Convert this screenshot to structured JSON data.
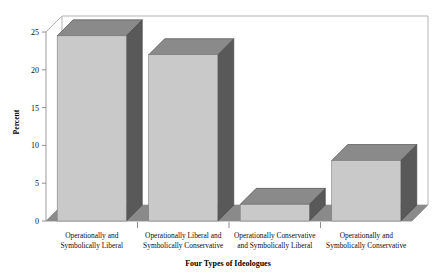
{
  "chart_data": {
    "type": "bar",
    "title": "",
    "xlabel": "Four Types of Ideologues",
    "ylabel": "Percent",
    "categories": [
      "Operationally and Symbolically Liberal",
      "Operationally Liberal and Symbolically Conservative",
      "Operationally Conservative and Symbolically Liberal",
      "Operationally and Symbolically Conservative"
    ],
    "category_lines": [
      [
        "Operationally and",
        "Symbolically Liberal"
      ],
      [
        "Operationally Liberal and",
        "Symbolically Conservative"
      ],
      [
        "Operationally Conservative",
        "and Symbolically Liberal"
      ],
      [
        "Operationally and",
        "Symbolically Conservative"
      ]
    ],
    "values": [
      24.5,
      22.0,
      2.2,
      8.0
    ],
    "ylim": [
      0,
      25
    ],
    "yticks": [
      0,
      5,
      10,
      15,
      20,
      25
    ],
    "ytick_labels": [
      "0",
      "5",
      "10",
      "15",
      "20",
      "25"
    ],
    "grid": false,
    "legend": "none",
    "style": "3d-bar"
  },
  "colors": {
    "bar_front": "#c9c9c9",
    "bar_top": "#8a8a8a",
    "bar_side": "#595959",
    "floor": "#8a8a8a",
    "frame": "#b0b0b0",
    "axis": "#8f8f8f",
    "text": "#000000",
    "background": "#ffffff"
  },
  "axis": {
    "y_title": "Percent",
    "x_title": "Four Types of Ideologues"
  }
}
